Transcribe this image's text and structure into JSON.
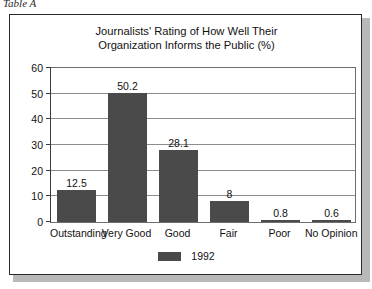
{
  "caption": "Table A",
  "chart_data": {
    "type": "bar",
    "title": "Journalists' Rating of How Well Their Organization Informs the Public (%)",
    "title_lines": [
      "Journalists' Rating of How Well Their",
      "Organization Informs the Public (%)"
    ],
    "categories": [
      "Outstanding",
      "Very Good",
      "Good",
      "Fair",
      "Poor",
      "No Opinion"
    ],
    "series": [
      {
        "name": "1992",
        "values": [
          12.5,
          50.2,
          28.1,
          8,
          0.8,
          0.6
        ],
        "value_labels": [
          "12.5",
          "50.2",
          "28.1",
          "8",
          "0.8",
          "0.6"
        ],
        "color": "#4a4a4a"
      }
    ],
    "xlabel": "",
    "ylabel": "",
    "ylim": [
      0,
      60
    ],
    "y_ticks": [
      0,
      10,
      20,
      30,
      40,
      50,
      60
    ],
    "y_tick_labels": [
      "0",
      "10",
      "20",
      "30",
      "40",
      "50",
      "60"
    ],
    "grid": true,
    "legend_position": "bottom-center",
    "legend_entries": [
      "1992"
    ]
  },
  "colors": {
    "bar": "#4a4a4a",
    "frame": "#2a2a2a",
    "gridline": "#8c8c8c",
    "axis": "#3a3a3a",
    "shadow": "#b9b9b9",
    "background": "#ffffff"
  }
}
